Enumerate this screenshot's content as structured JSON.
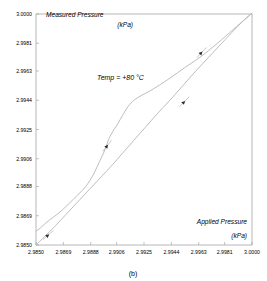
{
  "figure": {
    "caption": "(b)"
  },
  "chart_data": {
    "type": "line",
    "title": "",
    "xlabel": "Applied Pressure",
    "xlabel_unit": "(kPa)",
    "ylabel": "Measured Pressure",
    "ylabel_unit": "(kPa)",
    "annotation": "Temp = +80 °C",
    "grid": false,
    "legend": "none",
    "xlim": [
      2.985,
      3.0
    ],
    "ylim": [
      2.985,
      3.0
    ],
    "xticks": [
      "2.9850",
      "2.9869",
      "2.9888",
      "2.9906",
      "2.9925",
      "2.9944",
      "2.9963",
      "2.9981",
      "3.0000"
    ],
    "xtick_values": [
      2.985,
      2.9869,
      2.9888,
      2.9906,
      2.9925,
      2.9944,
      2.9963,
      2.9981,
      3.0
    ],
    "yticks": [
      "2.9850",
      "2.9869",
      "2.9888",
      "2.9906",
      "2.9925",
      "2.9944",
      "2.9963",
      "2.9981",
      "3.0000"
    ],
    "ytick_values": [
      2.985,
      2.9869,
      2.9888,
      2.9906,
      2.9925,
      2.9944,
      2.9963,
      2.9981,
      3.0
    ],
    "series": [
      {
        "name": "upscale-branch",
        "x": [
          2.985,
          2.9853,
          2.9857,
          2.9862,
          2.9868,
          2.9873,
          2.9879,
          2.9885,
          2.989,
          2.9894,
          2.98975,
          2.99,
          2.9902,
          2.99045,
          2.9907,
          2.991,
          2.9914,
          2.9918,
          2.9923,
          2.9929,
          2.9936,
          2.9944,
          2.9953,
          2.9964,
          2.9976,
          2.9987,
          2.9995,
          3.0
        ],
        "y": [
          2.9859,
          2.9861,
          2.98645,
          2.9868,
          2.98725,
          2.9877,
          2.98825,
          2.98885,
          2.9896,
          2.9904,
          2.9911,
          2.99175,
          2.99215,
          2.99255,
          2.9929,
          2.9934,
          2.994,
          2.9944,
          2.9947,
          2.995,
          2.9954,
          2.9959,
          2.9965,
          2.9972,
          2.9981,
          2.999,
          2.99965,
          3.00005
        ]
      },
      {
        "name": "downscale-branch",
        "x": [
          2.985,
          2.9856,
          2.9863,
          2.987,
          2.9877,
          2.9884,
          2.989,
          2.9896,
          2.9903,
          2.991,
          2.9918,
          2.9926,
          2.9934,
          2.9943,
          2.9952,
          2.9961,
          2.997,
          2.9979,
          2.9988,
          2.9995,
          3.0
        ],
        "y": [
          2.985,
          2.98555,
          2.9862,
          2.9869,
          2.9876,
          2.9883,
          2.9889,
          2.9895,
          2.9902,
          2.99095,
          2.9918,
          2.99265,
          2.9935,
          2.9944,
          2.99535,
          2.9963,
          2.9972,
          2.9981,
          2.999,
          2.99965,
          3.00005
        ]
      }
    ],
    "direction_arrows": [
      {
        "name": "arrow-lower-left",
        "x": 2.98585,
        "y": 2.98565,
        "angle": 42
      },
      {
        "name": "arrow-mid-left",
        "x": 2.98995,
        "y": 2.99145,
        "angle": 52
      },
      {
        "name": "arrow-mid-right",
        "x": 2.9953,
        "y": 2.9943,
        "angle": 45
      },
      {
        "name": "arrow-upper-right",
        "x": 2.9965,
        "y": 2.9975,
        "angle": 47
      }
    ]
  }
}
